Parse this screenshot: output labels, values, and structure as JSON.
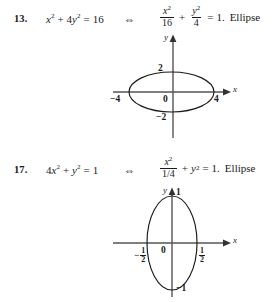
{
  "page": {
    "background": "#ffffff",
    "ink": "#1a1a1a"
  },
  "problems": [
    {
      "number": "13.",
      "equation_left": {
        "term1_base": "x",
        "term1_exp": "2",
        "plus": "+",
        "term2_coef": "4",
        "term2_base": "y",
        "term2_exp": "2",
        "equals": "=",
        "rhs": "16"
      },
      "iff_symbol": "⇔",
      "equation_right": {
        "frac1_numer_base": "x",
        "frac1_numer_exp": "2",
        "frac1_denom": "16",
        "plus": "+",
        "frac2_numer_base": "y",
        "frac2_numer_exp": "2",
        "frac2_denom": "4",
        "equals": "=",
        "rhs": "1.",
        "conclusion": "Ellipse"
      },
      "graph": {
        "x_axis_label": "x",
        "y_axis_label": "y",
        "origin_label": "0",
        "x_tick_left": "−4",
        "x_tick_right": "4",
        "y_tick_top": "2",
        "y_tick_bottom": "−2",
        "curve": "ellipse",
        "semi_axis_x": 4,
        "semi_axis_y": 2
      }
    },
    {
      "number": "17.",
      "equation_left": {
        "term1_coef": "4",
        "term1_base": "x",
        "term1_exp": "2",
        "plus": "+",
        "term2_base": "y",
        "term2_exp": "2",
        "equals": "=",
        "rhs": "1"
      },
      "iff_symbol": "⇔",
      "equation_right": {
        "frac1_numer_base": "x",
        "frac1_numer_exp": "2",
        "frac1_denom": "1/4",
        "plus": "+",
        "term2_base": "y",
        "term2_exp": "2",
        "equals": "=",
        "rhs": "1.",
        "conclusion": "Ellipse"
      },
      "graph": {
        "x_axis_label": "x",
        "y_axis_label": "y",
        "origin_label": "0",
        "x_tick_left_sign": "−",
        "x_tick_left_numer": "1",
        "x_tick_left_denom": "2",
        "x_tick_right_numer": "1",
        "x_tick_right_denom": "2",
        "y_tick_top": "1",
        "y_tick_bottom": "−1",
        "curve": "ellipse",
        "semi_axis_x": 0.5,
        "semi_axis_y": 1
      }
    }
  ]
}
